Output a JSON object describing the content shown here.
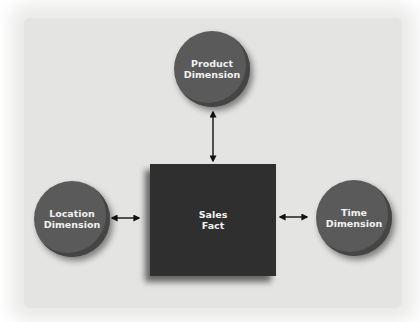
{
  "diagram": {
    "type": "star-schema",
    "center": {
      "id": "sales-fact",
      "label": "Sales\nFact",
      "shape": "square",
      "color": "#2f2f2f"
    },
    "nodes": [
      {
        "id": "product-dimension",
        "label": "Product\nDimension",
        "shape": "circle",
        "color": "#5a5a5a",
        "position": "top"
      },
      {
        "id": "location-dimension",
        "label": "Location\nDimension",
        "shape": "circle",
        "color": "#5a5a5a",
        "position": "left"
      },
      {
        "id": "time-dimension",
        "label": "Time\nDimension",
        "shape": "circle",
        "color": "#5a5a5a",
        "position": "right"
      }
    ],
    "edges": [
      {
        "from": "product-dimension",
        "to": "sales-fact",
        "style": "double-arrow"
      },
      {
        "from": "location-dimension",
        "to": "sales-fact",
        "style": "double-arrow"
      },
      {
        "from": "time-dimension",
        "to": "sales-fact",
        "style": "double-arrow"
      }
    ],
    "background_color": "#e4e4e2"
  }
}
